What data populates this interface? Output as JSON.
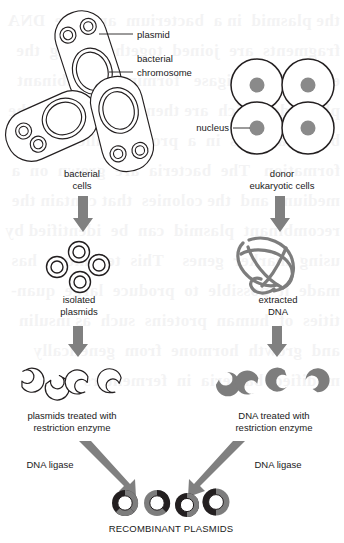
{
  "figure": {
    "background_text_note": "faint show-through text from reverse of printed page"
  },
  "colors": {
    "outline": "#231f20",
    "gray_fill": "#7d7d7d",
    "arrow_gray": "#808080",
    "nucleus_gray": "#8a8a8a",
    "white": "#ffffff"
  },
  "labels": {
    "plasmid": "plasmid",
    "bacterial_chromosome_line1": "bacterial",
    "bacterial_chromosome_line2": "chromosome",
    "nucleus": "nucleus",
    "bacterial_cells_line1": "bacterial",
    "bacterial_cells_line2": "cells",
    "donor_cells_line1": "donor",
    "donor_cells_line2": "eukaryotic cells",
    "isolated_plasmids_line1": "isolated",
    "isolated_plasmids_line2": "plasmids",
    "extracted_dna_line1": "extracted",
    "extracted_dna_line2": "DNA",
    "plasmids_cut_line1": "plasmids treated with",
    "plasmids_cut_line2": "restriction enzyme",
    "dna_cut_line1": "DNA treated with",
    "dna_cut_line2": "restriction enzyme",
    "dna_ligase_left": "DNA ligase",
    "dna_ligase_right": "DNA ligase",
    "result": "RECOMBINANT PLASMIDS"
  },
  "counts": {
    "bacterial_cells": 3,
    "eukaryotic_cells": 4,
    "isolated_plasmids": 4,
    "cut_plasmid_fragments": 4,
    "cut_dna_fragments": 4,
    "recombinant_plasmids": 4
  },
  "bleed_text": "the plasmid  in a  bacterium  and  the  DNA\nfragments  are  joined  together  using  the\nenzyme DNA ligase   forming recombinant\nplasmids  which  are then  taken  up  by the\nbacterial  cells  in  a  process  called  trans-\nformation   The  bacteria  are  grown  on  a\nmedium  and  the colonies  that contain the\nrecombinant  plasmid  can  be  identified by\nusing  marker  genes    This  technique  has\nmade  it  possible  to  produce  large  quan-\ntities  of  human  proteins  such  as insulin\nand  growth  hormone  from  genetically\nmodified  bacteria  in  fermenters"
}
